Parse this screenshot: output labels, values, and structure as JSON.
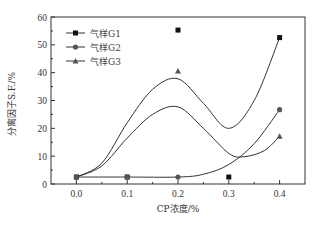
{
  "chart_data": {
    "type": "scatter",
    "title": "",
    "xlabel": "CP浓度/%",
    "ylabel": "分离因子S.F./%",
    "xlim": [
      -0.05,
      0.45
    ],
    "ylim": [
      0,
      60
    ],
    "x_ticks": [
      "0.0",
      "0.1",
      "0.2",
      "0.3",
      "0.4"
    ],
    "y_ticks": [
      "0",
      "10",
      "20",
      "30",
      "40",
      "50",
      "60"
    ],
    "grid": false,
    "legend_position": "upper left",
    "x": [
      0.0,
      0.1,
      0.2,
      0.3,
      0.4
    ],
    "series": [
      {
        "name": "气样G1",
        "marker": "square",
        "points": [
          [
            0.0,
            2.5
          ],
          [
            0.1,
            2.5
          ],
          [
            0.2,
            55.3
          ],
          [
            0.3,
            2.5
          ],
          [
            0.4,
            52.6
          ]
        ]
      },
      {
        "name": "气样G2",
        "marker": "circle",
        "points": [
          [
            0.0,
            2.5
          ],
          [
            0.1,
            2.5
          ],
          [
            0.2,
            2.5
          ],
          [
            0.4,
            26.7
          ]
        ]
      },
      {
        "name": "气样G3",
        "marker": "triangle",
        "points": [
          [
            0.2,
            40.6
          ],
          [
            0.4,
            17.2
          ]
        ]
      }
    ],
    "fit_curves": [
      {
        "name": "upper-fit",
        "points": [
          [
            0.0,
            2.5
          ],
          [
            0.05,
            7.5
          ],
          [
            0.1,
            22
          ],
          [
            0.15,
            34
          ],
          [
            0.2,
            37.8
          ],
          [
            0.25,
            29
          ],
          [
            0.3,
            20
          ],
          [
            0.35,
            30
          ],
          [
            0.4,
            52.6
          ]
        ]
      },
      {
        "name": "middle-fit",
        "points": [
          [
            0.0,
            2.5
          ],
          [
            0.05,
            6.5
          ],
          [
            0.1,
            16.5
          ],
          [
            0.15,
            25
          ],
          [
            0.2,
            27.7
          ],
          [
            0.25,
            20
          ],
          [
            0.3,
            11
          ],
          [
            0.33,
            9.8
          ],
          [
            0.37,
            12
          ],
          [
            0.4,
            17.2
          ]
        ]
      },
      {
        "name": "lower-fit",
        "points": [
          [
            0.0,
            2.5
          ],
          [
            0.1,
            2.5
          ],
          [
            0.2,
            2.5
          ],
          [
            0.25,
            3.5
          ],
          [
            0.3,
            7
          ],
          [
            0.35,
            14.5
          ],
          [
            0.4,
            26.7
          ]
        ]
      }
    ]
  },
  "legend": {
    "items": [
      {
        "label": "气样G1",
        "marker": "square"
      },
      {
        "label": "气样G2",
        "marker": "circle"
      },
      {
        "label": "气样G3",
        "marker": "triangle"
      }
    ]
  },
  "axes": {
    "xlabel": "CP浓度/%",
    "ylabel": "分离因子S.F./%"
  },
  "colors": {
    "square": "#111111",
    "circle": "#555555",
    "triangle": "#555555",
    "line": "#333333",
    "frame": "#333333"
  }
}
